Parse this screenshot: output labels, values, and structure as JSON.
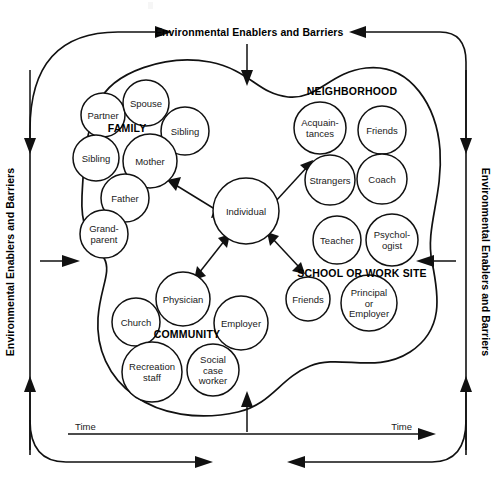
{
  "diagram": {
    "type": "conceptual-ecological-model",
    "canvas": {
      "width": 493,
      "height": 484
    },
    "colors": {
      "background": "#ffffff",
      "stroke": "#111111",
      "text": "#1a1a1a",
      "heading_text": "#000000"
    }
  },
  "environment": {
    "top_label": "Environmental Enablers and Barriers",
    "left_label": "Environmental Enablers and Barriers",
    "right_label": "Environmental Enablers and Barriers",
    "time_label_left": "Time",
    "time_label_right": "Time"
  },
  "center": {
    "label": "Individual"
  },
  "groups": [
    {
      "id": "family",
      "label": "FAMILY",
      "label_x": 127,
      "label_y": 129,
      "members": [
        {
          "label": "Partner",
          "x": 103,
          "y": 115,
          "r": 22,
          "lines": [
            "Partner"
          ]
        },
        {
          "label": "Spouse",
          "x": 146,
          "y": 103,
          "r": 23,
          "lines": [
            "Spouse"
          ]
        },
        {
          "label": "Sibling",
          "x": 185,
          "y": 131,
          "r": 24,
          "lines": [
            "Sibling"
          ]
        },
        {
          "label": "Sibling",
          "x": 96,
          "y": 158,
          "r": 23,
          "lines": [
            "Sibling"
          ]
        },
        {
          "label": "Mother",
          "x": 150,
          "y": 161,
          "r": 27,
          "lines": [
            "Mother"
          ]
        },
        {
          "label": "Father",
          "x": 125,
          "y": 198,
          "r": 24,
          "lines": [
            "Father"
          ]
        },
        {
          "label": "Grandparent",
          "x": 104,
          "y": 234,
          "r": 24,
          "lines": [
            "Grand-",
            "parent"
          ]
        }
      ]
    },
    {
      "id": "neighborhood",
      "label": "NEIGHBORHOOD",
      "label_x": 352,
      "label_y": 92,
      "members": [
        {
          "label": "Acquaintances",
          "x": 320,
          "y": 128,
          "r": 26,
          "lines": [
            "Acquain-",
            "tances"
          ]
        },
        {
          "label": "Friends",
          "x": 382,
          "y": 130,
          "r": 24,
          "lines": [
            "Friends"
          ]
        },
        {
          "label": "Strangers",
          "x": 330,
          "y": 180,
          "r": 25,
          "lines": [
            "Strangers"
          ]
        },
        {
          "label": "Coach",
          "x": 382,
          "y": 179,
          "r": 25,
          "lines": [
            "Coach"
          ]
        }
      ]
    },
    {
      "id": "school-or-work-site",
      "label": "SCHOOL OR WORK SITE",
      "label_x": 362,
      "label_y": 274,
      "members": [
        {
          "label": "Teacher",
          "x": 337,
          "y": 240,
          "r": 24,
          "lines": [
            "Teacher"
          ]
        },
        {
          "label": "Psychologist",
          "x": 392,
          "y": 240,
          "r": 26,
          "lines": [
            "Psychol-",
            "ogist"
          ]
        },
        {
          "label": "Friends",
          "x": 308,
          "y": 299,
          "r": 22,
          "lines": [
            "Friends"
          ]
        },
        {
          "label": "Principal or Employer",
          "x": 369,
          "y": 303,
          "r": 28,
          "lines": [
            "Principal",
            "or",
            "Employer"
          ]
        }
      ]
    },
    {
      "id": "community",
      "label": "COMMUNITY",
      "label_x": 187,
      "label_y": 335,
      "members": [
        {
          "label": "Physician",
          "x": 183,
          "y": 299,
          "r": 27,
          "lines": [
            "Physician"
          ]
        },
        {
          "label": "Church",
          "x": 136,
          "y": 322,
          "r": 24,
          "lines": [
            "Church"
          ]
        },
        {
          "label": "Employer",
          "x": 241,
          "y": 323,
          "r": 27,
          "lines": [
            "Employer"
          ]
        },
        {
          "label": "Recreation staff",
          "x": 152,
          "y": 372,
          "r": 30,
          "lines": [
            "Recreation",
            "staff"
          ]
        },
        {
          "label": "Social case worker",
          "x": 213,
          "y": 370,
          "r": 26,
          "lines": [
            "Social",
            "case",
            "worker"
          ]
        }
      ]
    }
  ],
  "connections": [
    {
      "from": "individual",
      "to": "family",
      "kind": "double-headed"
    },
    {
      "from": "individual",
      "to": "neighborhood",
      "kind": "single-headed"
    },
    {
      "from": "individual",
      "to": "community",
      "kind": "double-headed"
    },
    {
      "from": "individual",
      "to": "school-or-work-site",
      "kind": "double-headed"
    }
  ]
}
